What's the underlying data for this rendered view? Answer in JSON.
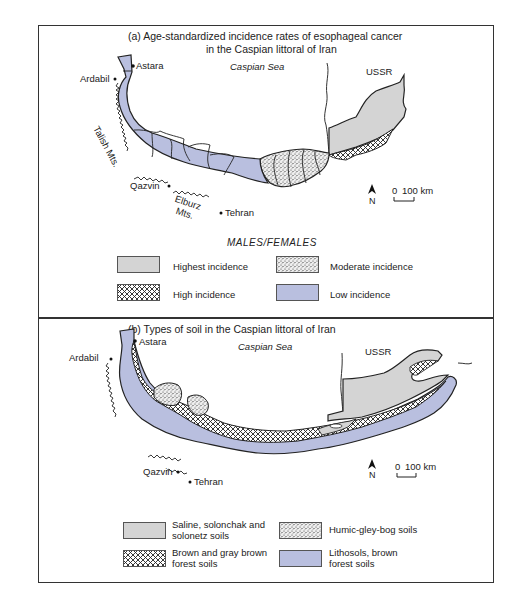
{
  "panel_a": {
    "title_line1": "(a)  Age-standardized incidence rates of esophageal cancer",
    "title_line2": "in the Caspian littoral of Iran",
    "labels": {
      "sea": "Caspian Sea",
      "ussr": "USSR",
      "astara": "Astara",
      "ardabil": "Ardabil",
      "talish": "Talish Mts.",
      "qazvin": "Qazvin",
      "elburz1": "Elburz",
      "elburz2": "Mts.",
      "tehran": "Tehran",
      "north": "N",
      "scale_zero": "0",
      "scale_value": "100 km"
    },
    "legend": {
      "heading": "MALES/FEMALES",
      "items": [
        {
          "label": "Highest incidence",
          "pattern": "solid-gray",
          "color": "#d4d4d4"
        },
        {
          "label": "Moderate incidence",
          "pattern": "stipple",
          "color": "#e8e8e8"
        },
        {
          "label": "High incidence",
          "pattern": "crosshatch",
          "color": "#ffffff"
        },
        {
          "label": "Low incidence",
          "pattern": "solid-blue",
          "color": "#b9bfdf"
        }
      ]
    }
  },
  "panel_b": {
    "title": "(b) Types of soil in the Caspian littoral of Iran",
    "labels": {
      "sea": "Caspian Sea",
      "ussr": "USSR",
      "astara": "Astara",
      "ardabil": "Ardabil",
      "qazvin": "Qazvin",
      "tehran": "Tehran",
      "north": "N",
      "scale_zero": "0",
      "scale_value": "100 km"
    },
    "legend": {
      "items": [
        {
          "label_line1": "Saline, solonchak and",
          "label_line2": "solonetz soils",
          "pattern": "solid-gray",
          "color": "#d4d4d4"
        },
        {
          "label_line1": "Humic-gley-bog soils",
          "label_line2": "",
          "pattern": "stipple",
          "color": "#e8e8e8"
        },
        {
          "label_line1": "Brown and gray brown",
          "label_line2": "forest soils",
          "pattern": "crosshatch",
          "color": "#ffffff"
        },
        {
          "label_line1": "Lithosols, brown",
          "label_line2": "forest soils",
          "pattern": "solid-blue",
          "color": "#b9bfdf"
        }
      ]
    }
  },
  "colors": {
    "low_blue": "#b9bfdf",
    "highest_gray": "#d4d4d4",
    "outline": "#222222"
  }
}
